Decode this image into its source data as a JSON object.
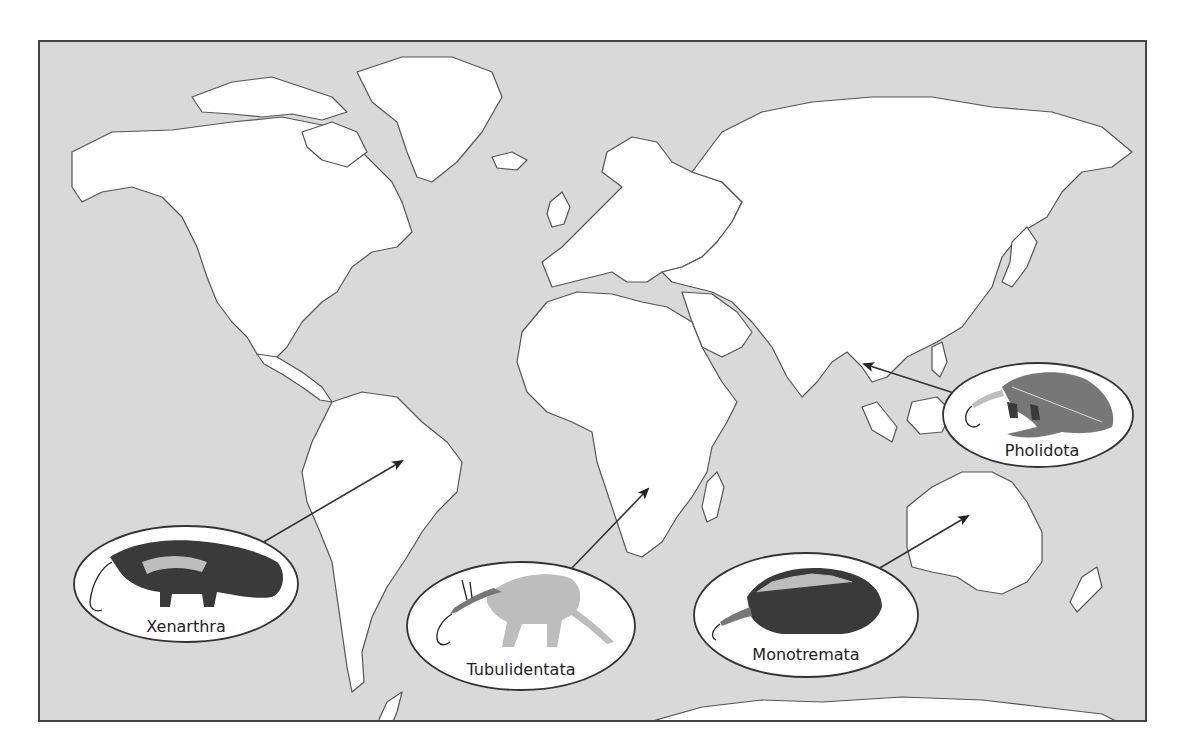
{
  "map": {
    "type": "world-map",
    "background_ocean_color": "#d9d9d9",
    "land_color": "#ffffff",
    "frame_color": "#444444"
  },
  "callouts": [
    {
      "id": "xenarthra",
      "label": "Xenarthra",
      "animal": "anteater",
      "region": "South America"
    },
    {
      "id": "tubulidentata",
      "label": "Tubulidentata",
      "animal": "aardvark",
      "region": "Africa"
    },
    {
      "id": "monotremata",
      "label": "Monotremata",
      "animal": "echidna",
      "region": "Australia"
    },
    {
      "id": "pholidota",
      "label": "Pholidota",
      "animal": "pangolin",
      "region": "Southeast Asia"
    }
  ]
}
